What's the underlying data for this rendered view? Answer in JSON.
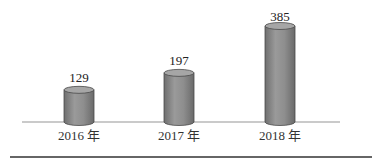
{
  "chart_data": {
    "type": "bar",
    "style": "3d-cylinder",
    "title": "",
    "xlabel": "",
    "ylabel": "",
    "categories": [
      "2016 年",
      "2017 年",
      "2018 年"
    ],
    "values": [
      129,
      197,
      385
    ],
    "data_labels": [
      "129",
      "197",
      "385"
    ],
    "ylim": [
      0,
      400
    ],
    "grid": false,
    "legend": null,
    "colors": {
      "bar_body": "#8c8c8c",
      "bar_top": "#a6a6a6",
      "bar_edge": "#4a4a4a",
      "baseline": "#b8b8b8",
      "divider": "#333333"
    }
  },
  "labels": {
    "v0": "129",
    "v1": "197",
    "v2": "385",
    "c0": "2016 年",
    "c1": "2017 年",
    "c2": "2018 年"
  }
}
